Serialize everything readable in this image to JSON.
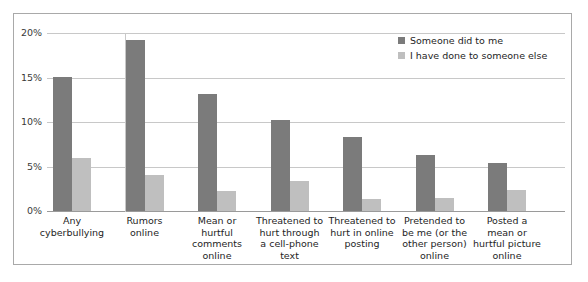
{
  "chart_data": {
    "type": "bar",
    "title": "",
    "xlabel": "",
    "ylabel": "",
    "ylim": [
      0,
      20
    ],
    "ytick_labels": [
      "0%",
      "5%",
      "10%",
      "15%",
      "20%"
    ],
    "ytick_values": [
      0,
      5,
      10,
      15,
      20
    ],
    "grid": true,
    "legend_position": "top-right",
    "categories": [
      "Any cyberbullying",
      "Rumors online",
      "Mean or hurtful comments online",
      "Threatened to hurt through a cell-phone text",
      "Threatened to hurt in online posting",
      "Pretended to be me (or the other person) online",
      "Posted a mean or hurtful picture online"
    ],
    "category_lines": [
      [
        "Any",
        "cyberbullying"
      ],
      [
        "Rumors",
        "online"
      ],
      [
        "Mean or",
        "hurtful",
        "comments",
        "online"
      ],
      [
        "Threatened to",
        "hurt through",
        "a cell-phone",
        "text"
      ],
      [
        "Threatened to",
        "hurt in online",
        "posting"
      ],
      [
        "Pretended to",
        "be me (or the",
        "other person)",
        "online"
      ],
      [
        "Posted a",
        "mean or",
        "hurtful picture",
        "online"
      ]
    ],
    "series": [
      {
        "name": "Someone did to me",
        "color": "#7b7b7b",
        "values": [
          15.1,
          19.2,
          13.1,
          10.2,
          8.3,
          6.3,
          5.4
        ]
      },
      {
        "name": "I have done to someone else",
        "color": "#bfbfbf",
        "values": [
          6.0,
          4.1,
          2.2,
          3.4,
          1.3,
          1.5,
          2.4
        ]
      }
    ]
  },
  "legend": {
    "items": [
      {
        "label": "Someone did to me",
        "swatch": "dark"
      },
      {
        "label": "I have done to someone else",
        "swatch": "light"
      }
    ]
  },
  "colors": {
    "series_dark": "#7b7b7b",
    "series_light": "#bfbfbf",
    "gridline": "#c8c8c8",
    "border": "#a9a9a9",
    "text": "#1e1e1e"
  }
}
